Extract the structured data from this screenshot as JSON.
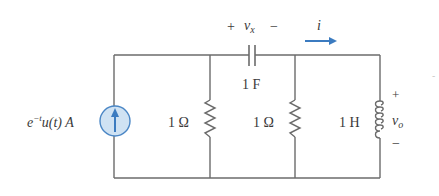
{
  "diagram": {
    "type": "circuit",
    "colors": {
      "wire": "#6b6b6b",
      "source_fill": "#cfe2f3",
      "source_stroke": "#4a86c5",
      "arrow": "#3b7bc0",
      "text": "#3a3a3a"
    },
    "source": {
      "label_base": "e",
      "label_exp": "−t",
      "label_rest": "u(t) A",
      "icon": "current-source-up-arrow"
    },
    "resistor1": {
      "label": "1 Ω"
    },
    "resistor2": {
      "label": "1 Ω"
    },
    "capacitor": {
      "label": "1 F",
      "voltage_plus": "+",
      "voltage_name": "v",
      "voltage_sub": "x",
      "voltage_minus": "−"
    },
    "current": {
      "label": "i",
      "icon": "right-arrow"
    },
    "inductor": {
      "label": "1 H",
      "voltage_plus": "+",
      "voltage_name": "v",
      "voltage_sub": "o",
      "voltage_minus": "−"
    },
    "stray_mark": "-"
  }
}
